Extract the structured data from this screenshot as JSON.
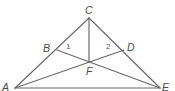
{
  "diagram": {
    "points": {
      "A": {
        "label": "A",
        "x": 15,
        "y": 88
      },
      "B": {
        "label": "B",
        "x": 57,
        "y": 50
      },
      "C": {
        "label": "C",
        "x": 89,
        "y": 18
      },
      "D": {
        "label": "D",
        "x": 124,
        "y": 50
      },
      "E": {
        "label": "E",
        "x": 160,
        "y": 88
      },
      "F": {
        "label": "F",
        "x": 89,
        "y": 62
      }
    },
    "segments": [
      [
        "A",
        "C"
      ],
      [
        "C",
        "E"
      ],
      [
        "A",
        "E"
      ],
      [
        "C",
        "F"
      ],
      [
        "B",
        "E"
      ],
      [
        "A",
        "D"
      ]
    ],
    "angle_labels": {
      "one": "1",
      "two": "2"
    }
  }
}
